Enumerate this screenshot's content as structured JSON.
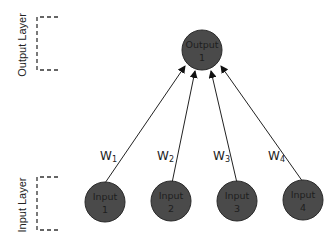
{
  "diagram": {
    "layers": [
      {
        "id": "output",
        "label": "Output Layer"
      },
      {
        "id": "input",
        "label": "Input Layer"
      }
    ],
    "output_nodes": [
      {
        "line1": "Output",
        "line2": "1"
      }
    ],
    "input_nodes": [
      {
        "line1": "Input",
        "line2": "1"
      },
      {
        "line1": "Input",
        "line2": "2"
      },
      {
        "line1": "Input",
        "line2": "3"
      },
      {
        "line1": "Input",
        "line2": "4"
      }
    ],
    "weights": [
      {
        "base": "W",
        "sub": "1"
      },
      {
        "base": "W",
        "sub": "2"
      },
      {
        "base": "W",
        "sub": "3"
      },
      {
        "base": "W",
        "sub": "4"
      }
    ],
    "colors": {
      "node_fill": "#4a4a4a",
      "node_stroke": "#2a2a2a",
      "edge": "#222222",
      "bracket": "#333333"
    }
  }
}
